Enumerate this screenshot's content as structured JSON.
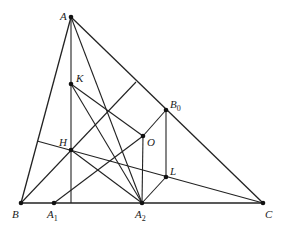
{
  "diagram": {
    "type": "geometry",
    "points": {
      "A": {
        "label": "A",
        "x": 71,
        "y": 17,
        "lx": 60,
        "ly": 20
      },
      "B": {
        "label": "B",
        "x": 21,
        "y": 203,
        "lx": 12,
        "ly": 218
      },
      "C": {
        "label": "C",
        "x": 263,
        "y": 203,
        "lx": 265,
        "ly": 218
      },
      "K": {
        "label": "K",
        "x": 71,
        "y": 84,
        "lx": 76,
        "ly": 82
      },
      "H": {
        "label": "H",
        "x": 71,
        "y": 150,
        "lx": 59,
        "ly": 146
      },
      "O": {
        "label": "O",
        "x": 143,
        "y": 136,
        "lx": 147,
        "ly": 146
      },
      "B0": {
        "label": "B",
        "sub": "0",
        "x": 166,
        "y": 110,
        "lx": 170,
        "ly": 108
      },
      "L": {
        "label": "L",
        "x": 166,
        "y": 177,
        "lx": 170,
        "ly": 175
      },
      "A1": {
        "label": "A",
        "sub": "1",
        "x": 54,
        "y": 203,
        "lx": 47,
        "ly": 218
      },
      "A2": {
        "label": "A",
        "sub": "2",
        "x": 142,
        "y": 203,
        "lx": 135,
        "ly": 218
      }
    },
    "segments": [
      [
        "A",
        "B"
      ],
      [
        "A",
        "C"
      ],
      [
        "B",
        "C"
      ],
      [
        "A",
        "Hfoot"
      ],
      [
        "B",
        "Bfoot"
      ],
      [
        "C",
        "Cfoot"
      ],
      [
        "A",
        "A2"
      ],
      [
        "K",
        "O"
      ],
      [
        "K",
        "A2"
      ],
      [
        "H",
        "A2"
      ],
      [
        "A1",
        "O"
      ],
      [
        "O",
        "A2"
      ],
      [
        "O",
        "B0"
      ],
      [
        "B0",
        "L"
      ],
      [
        "L",
        "A2"
      ]
    ],
    "auxiliary_points": {
      "Hfoot": {
        "x": 71,
        "y": 203
      },
      "Bfoot": {
        "x": 136,
        "y": 82
      },
      "Cfoot": {
        "x": 37,
        "y": 141
      }
    }
  }
}
